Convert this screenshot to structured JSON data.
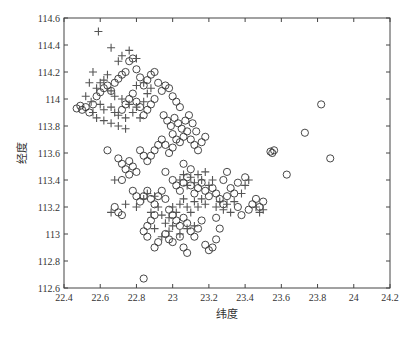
{
  "chart_data": {
    "type": "scatter",
    "title": "",
    "xlabel": "纬度",
    "ylabel": "经度",
    "xlim": [
      22.4,
      24.2
    ],
    "ylim": [
      112.6,
      114.6
    ],
    "xticks": [
      "22.4",
      "22.6",
      "22.8",
      "23",
      "23.2",
      "23.4",
      "23.6",
      "23.8",
      "24",
      "24.2"
    ],
    "yticks": [
      "112.6",
      "112.8",
      "113",
      "113.2",
      "113.4",
      "113.6",
      "113.8",
      "114",
      "114.2",
      "114.4",
      "114.6"
    ],
    "grid": false,
    "legend": null,
    "series": [
      {
        "name": "circle",
        "marker": "o",
        "color": "#333333",
        "points": [
          [
            22.47,
            113.93
          ],
          [
            22.49,
            113.95
          ],
          [
            22.5,
            113.92
          ],
          [
            22.52,
            113.94
          ],
          [
            22.54,
            113.9
          ],
          [
            22.56,
            113.96
          ],
          [
            22.58,
            114.02
          ],
          [
            22.6,
            114.05
          ],
          [
            22.62,
            114.08
          ],
          [
            22.64,
            114.1
          ],
          [
            22.66,
            114.06
          ],
          [
            22.68,
            114.12
          ],
          [
            22.7,
            114.15
          ],
          [
            22.72,
            114.18
          ],
          [
            22.74,
            114.2
          ],
          [
            22.76,
            114.28
          ],
          [
            22.78,
            114.3
          ],
          [
            22.8,
            114.22
          ],
          [
            22.82,
            114.16
          ],
          [
            22.84,
            114.1
          ],
          [
            22.86,
            114.14
          ],
          [
            22.88,
            114.18
          ],
          [
            22.9,
            114.2
          ],
          [
            22.92,
            114.12
          ],
          [
            22.94,
            114.06
          ],
          [
            22.96,
            114.1
          ],
          [
            22.98,
            114.08
          ],
          [
            23.0,
            114.02
          ],
          [
            23.02,
            113.98
          ],
          [
            23.04,
            113.94
          ],
          [
            22.9,
            114.0
          ],
          [
            22.88,
            113.96
          ],
          [
            22.86,
            113.92
          ],
          [
            22.84,
            113.88
          ],
          [
            22.82,
            113.94
          ],
          [
            22.8,
            113.98
          ],
          [
            22.78,
            114.04
          ],
          [
            22.76,
            114.0
          ],
          [
            22.74,
            113.96
          ],
          [
            22.72,
            113.92
          ],
          [
            22.95,
            113.88
          ],
          [
            22.97,
            113.84
          ],
          [
            22.99,
            113.8
          ],
          [
            23.01,
            113.86
          ],
          [
            23.03,
            113.82
          ],
          [
            23.05,
            113.78
          ],
          [
            23.07,
            113.84
          ],
          [
            23.09,
            113.88
          ],
          [
            23.11,
            113.82
          ],
          [
            23.13,
            113.76
          ],
          [
            23.0,
            113.74
          ],
          [
            23.02,
            113.7
          ],
          [
            23.04,
            113.68
          ],
          [
            23.06,
            113.72
          ],
          [
            23.08,
            113.76
          ],
          [
            23.1,
            113.7
          ],
          [
            23.12,
            113.66
          ],
          [
            23.14,
            113.62
          ],
          [
            23.16,
            113.68
          ],
          [
            23.18,
            113.72
          ],
          [
            22.98,
            113.6
          ],
          [
            23.0,
            113.64
          ],
          [
            22.96,
            113.66
          ],
          [
            22.94,
            113.7
          ],
          [
            22.92,
            113.66
          ],
          [
            22.9,
            113.62
          ],
          [
            22.88,
            113.58
          ],
          [
            22.86,
            113.54
          ],
          [
            22.84,
            113.58
          ],
          [
            22.82,
            113.62
          ],
          [
            22.64,
            113.62
          ],
          [
            22.7,
            113.56
          ],
          [
            22.72,
            113.52
          ],
          [
            22.74,
            113.48
          ],
          [
            22.76,
            113.54
          ],
          [
            22.78,
            113.5
          ],
          [
            22.8,
            113.46
          ],
          [
            22.76,
            113.44
          ],
          [
            22.72,
            113.4
          ],
          [
            22.78,
            113.32
          ],
          [
            22.8,
            113.28
          ],
          [
            22.82,
            113.24
          ],
          [
            22.84,
            113.28
          ],
          [
            22.86,
            113.32
          ],
          [
            22.88,
            113.26
          ],
          [
            22.9,
            113.22
          ],
          [
            22.92,
            113.28
          ],
          [
            22.94,
            113.32
          ],
          [
            22.96,
            113.26
          ],
          [
            23.0,
            113.4
          ],
          [
            23.02,
            113.36
          ],
          [
            23.04,
            113.32
          ],
          [
            23.06,
            113.38
          ],
          [
            23.08,
            113.42
          ],
          [
            23.1,
            113.36
          ],
          [
            23.12,
            113.3
          ],
          [
            23.14,
            113.34
          ],
          [
            23.16,
            113.38
          ],
          [
            23.18,
            113.32
          ],
          [
            23.2,
            113.28
          ],
          [
            23.22,
            113.34
          ],
          [
            23.24,
            113.3
          ],
          [
            23.26,
            113.26
          ],
          [
            23.28,
            113.22
          ],
          [
            23.3,
            113.28
          ],
          [
            23.32,
            113.34
          ],
          [
            23.34,
            113.3
          ],
          [
            23.36,
            113.38
          ],
          [
            23.4,
            113.42
          ],
          [
            23.44,
            113.22
          ],
          [
            23.46,
            113.26
          ],
          [
            23.48,
            113.2
          ],
          [
            23.5,
            113.24
          ],
          [
            23.42,
            113.18
          ],
          [
            23.38,
            113.14
          ],
          [
            23.36,
            113.2
          ],
          [
            22.98,
            113.18
          ],
          [
            23.0,
            113.14
          ],
          [
            23.02,
            113.1
          ],
          [
            23.04,
            113.06
          ],
          [
            23.06,
            113.12
          ],
          [
            23.08,
            113.08
          ],
          [
            23.1,
            113.02
          ],
          [
            23.12,
            112.98
          ],
          [
            23.14,
            113.04
          ],
          [
            23.16,
            113.1
          ],
          [
            22.96,
            113.0
          ],
          [
            22.98,
            112.96
          ],
          [
            23.0,
            112.94
          ],
          [
            23.04,
            112.98
          ],
          [
            23.06,
            112.9
          ],
          [
            23.08,
            112.86
          ],
          [
            23.18,
            112.92
          ],
          [
            23.2,
            112.88
          ],
          [
            23.22,
            112.9
          ],
          [
            23.24,
            112.96
          ],
          [
            22.86,
            113.06
          ],
          [
            22.88,
            113.1
          ],
          [
            22.9,
            113.14
          ],
          [
            22.84,
            113.02
          ],
          [
            22.9,
            112.9
          ],
          [
            22.92,
            112.94
          ],
          [
            22.86,
            112.98
          ],
          [
            22.7,
            113.16
          ],
          [
            22.72,
            113.14
          ],
          [
            22.68,
            113.2
          ],
          [
            23.55,
            113.6
          ],
          [
            23.56,
            113.62
          ],
          [
            23.54,
            113.61
          ],
          [
            23.63,
            113.44
          ],
          [
            23.73,
            113.75
          ],
          [
            23.82,
            113.96
          ],
          [
            23.87,
            113.56
          ],
          [
            22.84,
            112.67
          ],
          [
            23.26,
            113.04
          ],
          [
            23.24,
            113.12
          ],
          [
            23.28,
            113.4
          ],
          [
            23.3,
            113.46
          ],
          [
            23.1,
            113.48
          ],
          [
            23.06,
            113.52
          ],
          [
            22.96,
            113.46
          ]
        ]
      },
      {
        "name": "plus",
        "marker": "+",
        "color": "#555555",
        "points": [
          [
            22.59,
            114.5
          ],
          [
            22.66,
            114.38
          ],
          [
            22.72,
            114.32
          ],
          [
            22.76,
            114.36
          ],
          [
            22.8,
            114.3
          ],
          [
            22.7,
            114.28
          ],
          [
            22.64,
            114.18
          ],
          [
            22.56,
            114.2
          ],
          [
            22.54,
            114.12
          ],
          [
            22.58,
            114.08
          ],
          [
            22.52,
            114.02
          ],
          [
            22.55,
            113.98
          ],
          [
            22.6,
            113.96
          ],
          [
            22.62,
            113.92
          ],
          [
            22.66,
            113.94
          ],
          [
            22.68,
            113.9
          ],
          [
            22.7,
            113.88
          ],
          [
            22.74,
            113.86
          ],
          [
            22.78,
            113.9
          ],
          [
            22.82,
            113.86
          ],
          [
            22.56,
            113.9
          ],
          [
            22.58,
            113.86
          ],
          [
            22.62,
            113.84
          ],
          [
            22.66,
            113.82
          ],
          [
            22.7,
            113.8
          ],
          [
            22.74,
            113.78
          ],
          [
            22.6,
            114.12
          ],
          [
            22.62,
            114.14
          ],
          [
            22.66,
            114.06
          ],
          [
            22.68,
            114.02
          ],
          [
            22.72,
            114.0
          ],
          [
            22.76,
            113.96
          ],
          [
            22.8,
            113.94
          ],
          [
            22.84,
            113.98
          ],
          [
            22.86,
            114.04
          ],
          [
            22.88,
            114.08
          ],
          [
            22.84,
            114.12
          ],
          [
            22.8,
            114.1
          ],
          [
            22.68,
            113.4
          ],
          [
            22.66,
            113.16
          ],
          [
            22.74,
            113.22
          ],
          [
            22.8,
            113.2
          ],
          [
            22.84,
            113.26
          ],
          [
            22.88,
            113.16
          ],
          [
            22.92,
            113.2
          ],
          [
            22.94,
            113.14
          ],
          [
            22.96,
            113.08
          ],
          [
            22.98,
            113.12
          ],
          [
            23.0,
            113.2
          ],
          [
            23.02,
            113.16
          ],
          [
            23.04,
            113.22
          ],
          [
            23.06,
            113.26
          ],
          [
            23.08,
            113.2
          ],
          [
            23.1,
            113.16
          ],
          [
            23.12,
            113.24
          ],
          [
            23.14,
            113.2
          ],
          [
            23.16,
            113.26
          ],
          [
            23.18,
            113.22
          ],
          [
            23.04,
            113.4
          ],
          [
            23.06,
            113.44
          ],
          [
            23.08,
            113.36
          ],
          [
            23.1,
            113.42
          ],
          [
            23.12,
            113.38
          ],
          [
            23.14,
            113.44
          ],
          [
            23.16,
            113.4
          ],
          [
            23.18,
            113.46
          ],
          [
            23.2,
            113.36
          ],
          [
            23.22,
            113.4
          ],
          [
            23.24,
            113.2
          ],
          [
            23.26,
            113.24
          ],
          [
            23.28,
            113.18
          ],
          [
            23.3,
            113.22
          ],
          [
            23.32,
            113.16
          ],
          [
            23.34,
            113.24
          ],
          [
            23.38,
            113.3
          ],
          [
            23.4,
            113.36
          ],
          [
            23.42,
            113.4
          ],
          [
            23.46,
            113.2
          ],
          [
            23.48,
            113.16
          ],
          [
            23.5,
            113.18
          ],
          [
            22.9,
            113.04
          ],
          [
            22.94,
            112.98
          ],
          [
            22.98,
            113.02
          ],
          [
            23.0,
            113.06
          ],
          [
            23.04,
            113.0
          ],
          [
            23.08,
            113.04
          ],
          [
            23.12,
            113.06
          ],
          [
            22.86,
            113.3
          ],
          [
            22.9,
            113.28
          ]
        ]
      }
    ],
    "caption": "图 某 数据分布"
  }
}
